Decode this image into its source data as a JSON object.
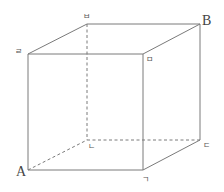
{
  "diagram": {
    "type": "cube",
    "vertices": {
      "front_top_left": {
        "label": "ㄹ",
        "x": 28,
        "y": 54
      },
      "back_top_left": {
        "label": "ㅂ",
        "x": 87,
        "y": 24
      },
      "front_top_right": {
        "label": "ㅁ",
        "x": 143,
        "y": 54
      },
      "back_top_right": {
        "label": "B",
        "x": 200,
        "y": 24
      },
      "front_bottom_left": {
        "label": "A",
        "x": 28,
        "y": 170
      },
      "front_bottom_right": {
        "label": "ㄱ",
        "x": 143,
        "y": 170
      },
      "back_bottom_right": {
        "label": "ㄷ",
        "x": 200,
        "y": 140
      },
      "back_bottom_left": {
        "label": "ㄴ",
        "x": 87,
        "y": 140
      }
    },
    "hidden_edges": [
      "A-ㄴ",
      "ㄴ-ㄷ",
      "ㄴ-ㅂ"
    ]
  }
}
